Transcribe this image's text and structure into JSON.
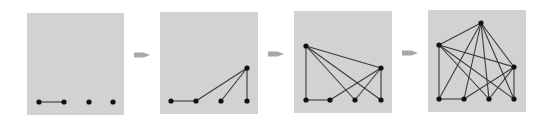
{
  "diagram": {
    "title": "",
    "panel_color": "#d2d2d2",
    "edge_color": "#3a3a3a",
    "node_color": "#111111",
    "arrow_color": "#a8a8a8",
    "panels": [
      {
        "name": "step-1",
        "rect": [
          27,
          13,
          97,
          102
        ],
        "nodes": [
          [
            39,
            102
          ],
          [
            64,
            102
          ],
          [
            89,
            102
          ],
          [
            113,
            102
          ]
        ],
        "edges": [
          [
            0,
            1
          ]
        ]
      },
      {
        "name": "step-2",
        "rect": [
          160,
          12,
          98,
          102
        ],
        "nodes": [
          [
            171,
            101
          ],
          [
            196,
            101
          ],
          [
            221,
            101
          ],
          [
            247,
            101
          ],
          [
            247,
            68
          ]
        ],
        "edges": [
          [
            0,
            1
          ],
          [
            1,
            4
          ],
          [
            2,
            4
          ],
          [
            3,
            4
          ]
        ]
      },
      {
        "name": "step-3",
        "rect": [
          294,
          11,
          98,
          102
        ],
        "nodes": [
          [
            306,
            100
          ],
          [
            330,
            100
          ],
          [
            355,
            100
          ],
          [
            381,
            100
          ],
          [
            381,
            68
          ],
          [
            306,
            46
          ]
        ],
        "edges": [
          [
            0,
            1
          ],
          [
            1,
            4
          ],
          [
            2,
            4
          ],
          [
            3,
            4
          ],
          [
            5,
            0
          ],
          [
            5,
            2
          ],
          [
            5,
            3
          ],
          [
            5,
            4
          ]
        ]
      },
      {
        "name": "step-4",
        "rect": [
          428,
          10,
          98,
          102
        ],
        "nodes": [
          [
            439,
            99
          ],
          [
            464,
            99
          ],
          [
            489,
            99
          ],
          [
            514,
            99
          ],
          [
            514,
            67
          ],
          [
            439,
            45
          ],
          [
            481,
            23
          ]
        ],
        "edges": [
          [
            0,
            1
          ],
          [
            1,
            4
          ],
          [
            2,
            4
          ],
          [
            3,
            4
          ],
          [
            5,
            0
          ],
          [
            5,
            2
          ],
          [
            5,
            3
          ],
          [
            5,
            4
          ],
          [
            6,
            5
          ],
          [
            6,
            0
          ],
          [
            6,
            1
          ],
          [
            6,
            2
          ],
          [
            6,
            3
          ],
          [
            6,
            4
          ]
        ]
      }
    ],
    "arrows": [
      {
        "x": 134,
        "y": 55,
        "w": 16
      },
      {
        "x": 268,
        "y": 54,
        "w": 16
      },
      {
        "x": 402,
        "y": 53,
        "w": 16
      }
    ]
  }
}
